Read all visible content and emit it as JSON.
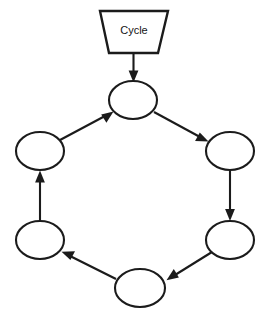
{
  "diagram": {
    "title_shape": {
      "label": "Cycle",
      "shape": "trapezoid",
      "name": "cycle-start-shape"
    },
    "nodes": [
      {
        "id": "n1",
        "label": "",
        "shape": "ellipse",
        "cx": 133,
        "cy": 100,
        "rx": 24,
        "ry": 19,
        "position": "top"
      },
      {
        "id": "n2",
        "label": "",
        "shape": "ellipse",
        "cx": 230,
        "cy": 151,
        "rx": 24,
        "ry": 19,
        "position": "upper-right"
      },
      {
        "id": "n3",
        "label": "",
        "shape": "ellipse",
        "cx": 230,
        "cy": 240,
        "rx": 24,
        "ry": 19,
        "position": "lower-right"
      },
      {
        "id": "n4",
        "label": "",
        "shape": "ellipse",
        "cx": 140,
        "cy": 288,
        "rx": 25,
        "ry": 19,
        "position": "bottom"
      },
      {
        "id": "n5",
        "label": "",
        "shape": "ellipse",
        "cx": 40,
        "cy": 240,
        "rx": 24,
        "ry": 19,
        "position": "lower-left"
      },
      {
        "id": "n6",
        "label": "",
        "shape": "ellipse",
        "cx": 40,
        "cy": 151,
        "rx": 24,
        "ry": 19,
        "position": "upper-left"
      }
    ],
    "edges": [
      {
        "from": "cycle-start-shape",
        "to": "n1",
        "direction": "down",
        "arrowhead": true
      },
      {
        "from": "n1",
        "to": "n2",
        "direction": "down-right",
        "arrowhead": true
      },
      {
        "from": "n2",
        "to": "n3",
        "direction": "down",
        "arrowhead": true
      },
      {
        "from": "n3",
        "to": "n4",
        "direction": "down-left",
        "arrowhead": true
      },
      {
        "from": "n4",
        "to": "n5",
        "direction": "up-left",
        "arrowhead": true
      },
      {
        "from": "n5",
        "to": "n6",
        "direction": "up",
        "arrowhead": true
      },
      {
        "from": "n6",
        "to": "n1",
        "direction": "up-right",
        "arrowhead": true
      }
    ],
    "colors": {
      "stroke": "#1b1b1b",
      "fill": "#ffffff",
      "background": "#ffffff",
      "text": "#141414"
    },
    "flow": "clockwise"
  }
}
